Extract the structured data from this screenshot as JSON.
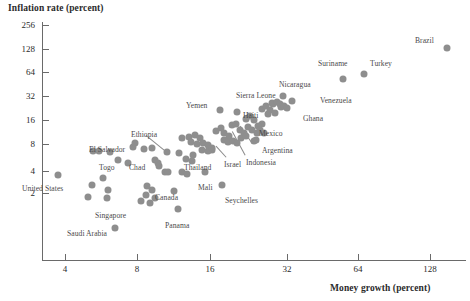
{
  "chart": {
    "type": "scatter",
    "title_y": "Inflation rate (percent)",
    "title_x": "Money growth (percent)",
    "x_scale": "log2",
    "y_scale": "log2",
    "xlim": [
      3.0,
      190
    ],
    "ylim": [
      0.7,
      300
    ],
    "x_ticks": [
      {
        "value": 4,
        "label": "4",
        "px": 65
      },
      {
        "value": 8,
        "label": "8",
        "px": 137
      },
      {
        "value": 16,
        "label": "16",
        "px": 210
      },
      {
        "value": 32,
        "label": "32",
        "px": 287
      },
      {
        "value": 64,
        "label": "64",
        "px": 358
      },
      {
        "value": 128,
        "label": "128",
        "px": 430
      }
    ],
    "y_ticks": [
      {
        "value": 256,
        "label": "256",
        "px": 25
      },
      {
        "value": 128,
        "label": "128",
        "px": 49
      },
      {
        "value": 64,
        "label": "64",
        "px": 72
      },
      {
        "value": 32,
        "label": "32",
        "px": 96
      },
      {
        "value": 16,
        "label": "16",
        "px": 120
      },
      {
        "value": 8,
        "label": "8",
        "px": 144
      },
      {
        "value": 4,
        "label": "4",
        "px": 171
      },
      {
        "value": 2,
        "label": "2",
        "px": 193
      }
    ],
    "grid": false,
    "legend": "none",
    "marker_color": "#8e8e8e",
    "axis_color": "#6a6a6a",
    "text_color": "#2b2b2b"
  },
  "chart_data": {
    "type": "scatter",
    "title": "",
    "xlabel": "Money growth (percent)",
    "ylabel": "Inflation rate (percent)",
    "xlim": [
      3.0,
      190
    ],
    "ylim": [
      0.7,
      300
    ],
    "xscale": "log",
    "yscale": "log",
    "grid": false,
    "legend": "none",
    "series": [
      {
        "name": "Countries",
        "points": [
          {
            "label": "Brazil",
            "x": 150,
            "y": 130,
            "px": 447,
            "py": 48
          },
          {
            "label": "Turkey",
            "x": 67,
            "y": 58,
            "px": 364,
            "py": 74
          },
          {
            "label": "Suriname",
            "x": 57,
            "y": 50,
            "px": 343,
            "py": 79
          },
          {
            "label": "Venezuela",
            "x": 34,
            "y": 27,
            "px": 292,
            "py": 101
          },
          {
            "label": "Nicaragua",
            "x": 30,
            "y": 32,
            "px": 283,
            "py": 96
          },
          {
            "label": "Ghana",
            "x": 30,
            "y": 23,
            "px": 281,
            "py": 107
          },
          {
            "label": "Sierra Leone",
            "x": 26,
            "y": 26,
            "px": 272,
            "py": 103
          },
          {
            "label": "Mexico",
            "x": 23,
            "y": 14,
            "px": 262,
            "py": 124
          },
          {
            "label": "Argentina",
            "x": 22,
            "y": 11,
            "px": 257,
            "py": 133
          },
          {
            "label": "Indonesia",
            "x": 21,
            "y": 9,
            "px": 254,
            "py": 141
          },
          {
            "label": "Haiti",
            "x": 19,
            "y": 20,
            "px": 237,
            "py": 112
          },
          {
            "label": "Yemen",
            "x": 17,
            "y": 21,
            "px": 220,
            "py": 110
          },
          {
            "label": "Israel",
            "x": 14,
            "y": 7,
            "px": 212,
            "py": 150
          },
          {
            "label": "Thailand",
            "x": 13,
            "y": 5,
            "px": 193,
            "py": 155
          },
          {
            "label": "Mali",
            "x": 14,
            "y": 3.4,
            "px": 205,
            "py": 172
          },
          {
            "label": "Seychelles",
            "x": 17,
            "y": 2.4,
            "px": 222,
            "py": 185
          },
          {
            "label": "Ethiopia",
            "x": 10,
            "y": 6,
            "px": 167,
            "py": 152
          },
          {
            "label": "Chad",
            "x": 9,
            "y": 6.5,
            "px": 152,
            "py": 148
          },
          {
            "label": "Togo",
            "x": 6.6,
            "y": 6,
            "px": 110,
            "py": 152
          },
          {
            "label": "El Salvador",
            "x": 8,
            "y": 7,
            "px": 133,
            "py": 147
          },
          {
            "label": "Canada",
            "x": 9,
            "y": 2,
            "px": 152,
            "py": 190
          },
          {
            "label": "Singapore",
            "x": 9,
            "y": 1.5,
            "px": 150,
            "py": 203
          },
          {
            "label": "Panama",
            "x": 11,
            "y": 1.2,
            "px": 178,
            "py": 209
          },
          {
            "label": "United States",
            "x": 3.8,
            "y": 3.4,
            "px": 58,
            "py": 175
          },
          {
            "label": "Saudi Arabia",
            "x": 6.8,
            "y": 0.9,
            "px": 115,
            "py": 228
          },
          {
            "label": "",
            "x": 5.2,
            "y": 6.2,
            "px": 93,
            "py": 151
          },
          {
            "label": "",
            "x": 5.4,
            "y": 6.2,
            "px": 99,
            "py": 151
          },
          {
            "label": "",
            "x": 5.6,
            "y": 3.0,
            "px": 103,
            "py": 178
          },
          {
            "label": "",
            "x": 5.2,
            "y": 2.4,
            "px": 92,
            "py": 185
          },
          {
            "label": "",
            "x": 5.0,
            "y": 1.8,
            "px": 88,
            "py": 197
          },
          {
            "label": "",
            "x": 5.9,
            "y": 2.0,
            "px": 108,
            "py": 190
          },
          {
            "label": "",
            "x": 5.9,
            "y": 1.8,
            "px": 107,
            "py": 198
          },
          {
            "label": "",
            "x": 8.0,
            "y": 7.4,
            "px": 135,
            "py": 143
          },
          {
            "label": "",
            "x": 8.5,
            "y": 6.6,
            "px": 144,
            "py": 149
          },
          {
            "label": "",
            "x": 9.3,
            "y": 5.0,
            "px": 155,
            "py": 160
          },
          {
            "label": "",
            "x": 9.5,
            "y": 4.6,
            "px": 158,
            "py": 163
          },
          {
            "label": "",
            "x": 9.5,
            "y": 4.4,
            "px": 159,
            "py": 166
          },
          {
            "label": "",
            "x": 10.0,
            "y": 3.6,
            "px": 165,
            "py": 172
          },
          {
            "label": "",
            "x": 10.2,
            "y": 3.6,
            "px": 168,
            "py": 172
          },
          {
            "label": "",
            "x": 8.8,
            "y": 2.3,
            "px": 147,
            "py": 186
          },
          {
            "label": "",
            "x": 8.7,
            "y": 1.9,
            "px": 146,
            "py": 195
          },
          {
            "label": "",
            "x": 9.3,
            "y": 1.8,
            "px": 155,
            "py": 198
          },
          {
            "label": "",
            "x": 8.3,
            "y": 1.6,
            "px": 141,
            "py": 201
          },
          {
            "label": "",
            "x": 11.5,
            "y": 3.6,
            "px": 182,
            "py": 172
          },
          {
            "label": "",
            "x": 11.3,
            "y": 6.0,
            "px": 179,
            "py": 153
          },
          {
            "label": "",
            "x": 12.0,
            "y": 5.2,
            "px": 186,
            "py": 159
          },
          {
            "label": "",
            "x": 11.5,
            "y": 9.5,
            "px": 182,
            "py": 138
          },
          {
            "label": "",
            "x": 12.2,
            "y": 9.7,
            "px": 189,
            "py": 137
          },
          {
            "label": "",
            "x": 12.8,
            "y": 10.0,
            "px": 195,
            "py": 135
          },
          {
            "label": "",
            "x": 13.3,
            "y": 9.3,
            "px": 200,
            "py": 138
          },
          {
            "label": "",
            "x": 12.4,
            "y": 8.4,
            "px": 191,
            "py": 142
          },
          {
            "label": "",
            "x": 13.0,
            "y": 8.0,
            "px": 197,
            "py": 144
          },
          {
            "label": "",
            "x": 13.6,
            "y": 8.2,
            "px": 203,
            "py": 143
          },
          {
            "label": "",
            "x": 14.2,
            "y": 7.8,
            "px": 208,
            "py": 145
          },
          {
            "label": "",
            "x": 13.5,
            "y": 7.0,
            "px": 202,
            "py": 150
          },
          {
            "label": "",
            "x": 14.2,
            "y": 6.9,
            "px": 208,
            "py": 151
          },
          {
            "label": "",
            "x": 14.8,
            "y": 7.3,
            "px": 212,
            "py": 148
          },
          {
            "label": "",
            "x": 15.3,
            "y": 11.5,
            "px": 216,
            "py": 131
          },
          {
            "label": "",
            "x": 16.0,
            "y": 12.5,
            "px": 221,
            "py": 128
          },
          {
            "label": "",
            "x": 16.5,
            "y": 11.0,
            "px": 224,
            "py": 133
          },
          {
            "label": "",
            "x": 17.2,
            "y": 10.2,
            "px": 229,
            "py": 136
          },
          {
            "label": "",
            "x": 17.8,
            "y": 13.5,
            "px": 232,
            "py": 125
          },
          {
            "label": "",
            "x": 18.5,
            "y": 14.0,
            "px": 236,
            "py": 124
          },
          {
            "label": "",
            "x": 19.2,
            "y": 12.0,
            "px": 240,
            "py": 130
          },
          {
            "label": "",
            "x": 20.0,
            "y": 11.0,
            "px": 244,
            "py": 133
          },
          {
            "label": "",
            "x": 16.5,
            "y": 9.0,
            "px": 224,
            "py": 140
          },
          {
            "label": "",
            "x": 17.2,
            "y": 8.6,
            "px": 228,
            "py": 142
          },
          {
            "label": "",
            "x": 18.0,
            "y": 8.8,
            "px": 233,
            "py": 141
          },
          {
            "label": "",
            "x": 18.8,
            "y": 8.2,
            "px": 237,
            "py": 143
          },
          {
            "label": "",
            "x": 19.5,
            "y": 9.5,
            "px": 241,
            "py": 138
          },
          {
            "label": "",
            "x": 20.5,
            "y": 16.5,
            "px": 246,
            "py": 119
          },
          {
            "label": "",
            "x": 21.5,
            "y": 18.0,
            "px": 250,
            "py": 116
          },
          {
            "label": "",
            "x": 22.5,
            "y": 16.0,
            "px": 254,
            "py": 120
          },
          {
            "label": "",
            "x": 21.0,
            "y": 13.0,
            "px": 248,
            "py": 127
          },
          {
            "label": "",
            "x": 22.0,
            "y": 12.0,
            "px": 252,
            "py": 130
          },
          {
            "label": "",
            "x": 23.5,
            "y": 13.5,
            "px": 258,
            "py": 126
          },
          {
            "label": "",
            "x": 24.5,
            "y": 22.0,
            "px": 262,
            "py": 109
          },
          {
            "label": "",
            "x": 25.5,
            "y": 24.0,
            "px": 266,
            "py": 106
          },
          {
            "label": "",
            "x": 26.5,
            "y": 21.0,
            "px": 270,
            "py": 110
          },
          {
            "label": "",
            "x": 24.0,
            "y": 12.0,
            "px": 260,
            "py": 130
          },
          {
            "label": "",
            "x": 25.0,
            "y": 11.0,
            "px": 264,
            "py": 133
          },
          {
            "label": "",
            "x": 27.5,
            "y": 25.5,
            "px": 273,
            "py": 104
          },
          {
            "label": "",
            "x": 28.5,
            "y": 26.5,
            "px": 277,
            "py": 102
          },
          {
            "label": "",
            "x": 29.5,
            "y": 25.0,
            "px": 280,
            "py": 104
          },
          {
            "label": "",
            "x": 30.5,
            "y": 24.0,
            "px": 284,
            "py": 106
          },
          {
            "label": "",
            "x": 31.5,
            "y": 23.0,
            "px": 287,
            "py": 108
          },
          {
            "label": "",
            "x": 12.5,
            "y": 4.8,
            "px": 192,
            "py": 161
          },
          {
            "label": "",
            "x": 12.0,
            "y": 3.4,
            "px": 187,
            "py": 174
          },
          {
            "label": "",
            "x": 10.8,
            "y": 2.0,
            "px": 174,
            "py": 191
          },
          {
            "label": "",
            "x": 20.5,
            "y": 10.2,
            "px": 246,
            "py": 136
          },
          {
            "label": "",
            "x": 23.0,
            "y": 9.0,
            "px": 256,
            "py": 140
          },
          {
            "label": "",
            "x": 26.0,
            "y": 19.0,
            "px": 268,
            "py": 114
          },
          {
            "label": "",
            "x": 28.0,
            "y": 19.5,
            "px": 275,
            "py": 113
          },
          {
            "label": "",
            "x": 7.0,
            "y": 5.0,
            "px": 118,
            "py": 160
          },
          {
            "label": "",
            "x": 7.6,
            "y": 4.7,
            "px": 128,
            "py": 163
          }
        ]
      }
    ]
  },
  "labels": [
    {
      "name": "brazil",
      "text": "Brazil",
      "x": 415,
      "y": 36,
      "leader": null
    },
    {
      "name": "turkey",
      "text": "Turkey",
      "x": 370,
      "y": 59,
      "leader": null
    },
    {
      "name": "suriname",
      "text": "Suriname",
      "x": 318,
      "y": 59,
      "leader": null
    },
    {
      "name": "nicaragua",
      "text": "Nicaragua",
      "x": 279,
      "y": 80,
      "leader": null
    },
    {
      "name": "venezuela",
      "text": "Venezuela",
      "x": 320,
      "y": 96,
      "leader": null
    },
    {
      "name": "sierra-leone",
      "text": "Sierra Leone",
      "x": 236,
      "y": 91,
      "leader": null
    },
    {
      "name": "ghana",
      "text": "Ghana",
      "x": 303,
      "y": 114,
      "leader": null
    },
    {
      "name": "yemen",
      "text": "Yemen",
      "x": 186,
      "y": 101,
      "leader": null
    },
    {
      "name": "haiti",
      "text": "Haiti",
      "x": 243,
      "y": 111,
      "leader": null
    },
    {
      "name": "mexico",
      "text": "Mexico",
      "x": 259,
      "y": 129,
      "leader": null
    },
    {
      "name": "argentina",
      "text": "Argentina",
      "x": 262,
      "y": 146,
      "leader": {
        "x1": 252,
        "y1": 143,
        "x2": 240,
        "y2": 126
      }
    },
    {
      "name": "indonesia",
      "text": "Indonesia",
      "x": 246,
      "y": 158,
      "leader": {
        "x1": 245,
        "y1": 155,
        "x2": 232,
        "y2": 131
      }
    },
    {
      "name": "ethiopia",
      "text": "Ethiopia",
      "x": 131,
      "y": 130,
      "leader": {
        "x1": 146,
        "y1": 135,
        "x2": 167,
        "y2": 152
      }
    },
    {
      "name": "el-salvador",
      "text": "El Salvador",
      "x": 89,
      "y": 145,
      "leader": null
    },
    {
      "name": "togo",
      "text": "Togo",
      "x": 99,
      "y": 163,
      "leader": null
    },
    {
      "name": "chad",
      "text": "Chad",
      "x": 129,
      "y": 163,
      "leader": null
    },
    {
      "name": "thailand",
      "text": "Thailand",
      "x": 184,
      "y": 163,
      "leader": null
    },
    {
      "name": "israel",
      "text": "Israel",
      "x": 224,
      "y": 160,
      "leader": {
        "x1": 226,
        "y1": 157,
        "x2": 216,
        "y2": 146
      }
    },
    {
      "name": "united-states",
      "text": "United States",
      "x": 22,
      "y": 184,
      "leader": null
    },
    {
      "name": "canada",
      "text": "Canada",
      "x": 155,
      "y": 193,
      "leader": null
    },
    {
      "name": "mali",
      "text": "Mali",
      "x": 198,
      "y": 183,
      "leader": null
    },
    {
      "name": "seychelles",
      "text": "Seychelles",
      "x": 225,
      "y": 196,
      "leader": null
    },
    {
      "name": "singapore",
      "text": "Singapore",
      "x": 95,
      "y": 211,
      "leader": null
    },
    {
      "name": "panama",
      "text": "Panama",
      "x": 165,
      "y": 221,
      "leader": null
    },
    {
      "name": "saudi-arabia",
      "text": "Saudi Arabia",
      "x": 67,
      "y": 229,
      "leader": null
    }
  ]
}
